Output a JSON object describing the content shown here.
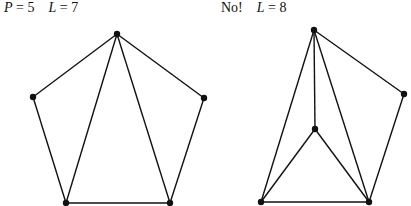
{
  "figures": [
    {
      "id": "left",
      "label": {
        "var1": "P",
        "eq1": " = 5",
        "var2": "L",
        "eq2": " = 7"
      },
      "nodes": [
        [
          117,
          34
        ],
        [
          33,
          97
        ],
        [
          204,
          98
        ],
        [
          66,
          203
        ],
        [
          170,
          203
        ]
      ],
      "edges": [
        [
          0,
          1
        ],
        [
          0,
          2
        ],
        [
          1,
          3
        ],
        [
          2,
          4
        ],
        [
          3,
          4
        ],
        [
          0,
          3
        ],
        [
          0,
          4
        ]
      ]
    },
    {
      "id": "right",
      "label": {
        "prefix": "No!",
        "var2": "L",
        "eq2": " = 8"
      },
      "nodes": [
        [
          314,
          30
        ],
        [
          404,
          94
        ],
        [
          315,
          129
        ],
        [
          261,
          202
        ],
        [
          369,
          202
        ]
      ],
      "edges": [
        [
          0,
          1
        ],
        [
          1,
          4
        ],
        [
          0,
          2
        ],
        [
          0,
          3
        ],
        [
          0,
          4
        ],
        [
          2,
          3
        ],
        [
          2,
          4
        ],
        [
          3,
          4
        ]
      ]
    }
  ]
}
